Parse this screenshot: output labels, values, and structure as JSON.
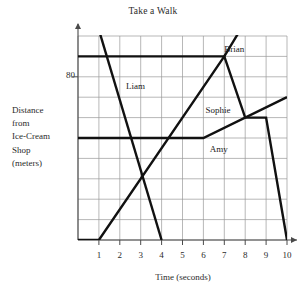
{
  "chart_data": {
    "type": "line",
    "title": "Take a Walk",
    "xlabel": "Time (seconds)",
    "ylabel": "Distance from Ice-Cream Shop (meters)",
    "ylabel_lines": [
      "Distance",
      "from",
      "Ice-Cream",
      "Shop",
      "(meters)"
    ],
    "xlim": [
      0,
      10
    ],
    "ylim": [
      0,
      100
    ],
    "xticks": [
      1,
      2,
      3,
      4,
      5,
      6,
      7,
      8,
      9,
      10
    ],
    "xtick_labels": [
      "1",
      "2",
      "3",
      "4",
      "5",
      "6",
      "7",
      "8",
      "9",
      "10"
    ],
    "yticks": [
      80
    ],
    "ytick_labels": [
      "80"
    ],
    "grid": true,
    "legend": "inline-labels",
    "line_color": "#111111",
    "grid_color": "#9a9a9a",
    "axis_color": "#4a4a4a",
    "series": [
      {
        "name": "Brian",
        "label_x": 7.0,
        "label_y": 93,
        "x": [
          0,
          7,
          8
        ],
        "y": [
          90,
          90,
          107
        ]
      },
      {
        "name": "Liam",
        "label_x": 2.3,
        "label_y": 75,
        "x": [
          1,
          4
        ],
        "y": [
          103,
          0
        ]
      },
      {
        "name": "Sophie",
        "label_x": 6.1,
        "label_y": 63,
        "x": [
          0,
          1,
          7,
          8,
          9,
          10
        ],
        "y": [
          0,
          0,
          90,
          60,
          60,
          0
        ]
      },
      {
        "name": "Amy",
        "label_x": 6.3,
        "label_y": 44,
        "x": [
          0,
          6,
          10
        ],
        "y": [
          50,
          50,
          70
        ]
      }
    ]
  }
}
